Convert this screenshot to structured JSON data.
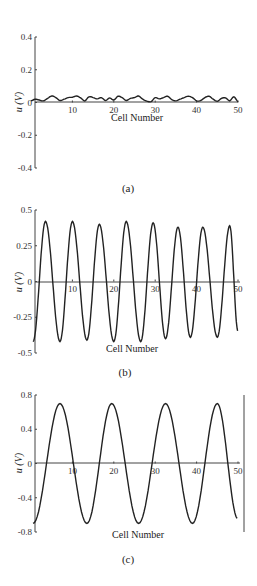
{
  "chart_data": [
    {
      "id": "a",
      "type": "line",
      "caption": "(a)",
      "title": "",
      "xlabel": "Cell Number",
      "ylabel": "u (V)",
      "xlim": [
        0,
        50
      ],
      "ylim": [
        -0.4,
        0.4
      ],
      "xticks": [
        10,
        20,
        30,
        40,
        50
      ],
      "yticks": [
        0.4,
        0.2,
        0,
        -0.2,
        -0.4
      ],
      "ytick_labels": [
        "0.4",
        "0.2",
        "0",
        "-0.2",
        "-0.4"
      ],
      "grid": false,
      "series": [
        {
          "name": "u",
          "x": [
            0,
            1,
            2,
            3,
            4,
            5,
            6,
            7,
            8,
            9,
            10,
            11,
            12,
            13,
            14,
            15,
            16,
            17,
            18,
            19,
            20,
            21,
            22,
            23,
            24,
            25,
            26,
            27,
            28,
            29,
            30,
            31,
            32,
            33,
            34,
            35,
            36,
            37,
            38,
            39,
            40,
            41,
            42,
            43,
            44,
            45,
            46,
            47,
            48,
            49,
            50
          ],
          "y": [
            0.01,
            0.02,
            0.015,
            0.01,
            0.025,
            0.04,
            0.03,
            0.012,
            0.02,
            0.03,
            0.032,
            0.04,
            0.028,
            0.01,
            0.035,
            0.03,
            0.022,
            0.03,
            0.012,
            0.028,
            0.015,
            0.038,
            0.03,
            0.012,
            0.025,
            0.03,
            0.04,
            0.02,
            0.008,
            0.005,
            0.03,
            0.022,
            0.03,
            0.038,
            0.018,
            0.01,
            0.02,
            0.03,
            0.038,
            0.03,
            0.01,
            0.012,
            0.03,
            0.038,
            0.02,
            0.008,
            0.025,
            0.028,
            0.01,
            0.035,
            0.005
          ]
        }
      ]
    },
    {
      "id": "b",
      "type": "line",
      "caption": "(b)",
      "title": "",
      "xlabel": "Cell Number",
      "ylabel": "u (V)",
      "xlim": [
        0,
        50
      ],
      "ylim": [
        -0.5,
        0.5
      ],
      "xticks": [
        10,
        20,
        30,
        40,
        50
      ],
      "yticks": [
        0.5,
        0.25,
        0,
        -0.25,
        -0.5
      ],
      "ytick_labels": [
        "0.5",
        "0.25",
        "0",
        "-0.25",
        "-0.5"
      ],
      "grid": false,
      "series": [
        {
          "name": "u",
          "model": "sinusoid",
          "amplitude_peaks": [
            0.42,
            0.42,
            0.4,
            0.42,
            0.41,
            0.38,
            0.38,
            0.39
          ],
          "amplitude_troughs": [
            -0.42,
            -0.41,
            -0.42,
            -0.42,
            -0.4,
            -0.39,
            -0.39
          ],
          "peak_x": [
            3.5,
            10,
            16.5,
            23,
            29.5,
            35.5,
            41.5,
            48
          ],
          "trough_x": [
            7,
            13.5,
            20,
            26.5,
            32.5,
            38.5,
            45
          ],
          "amplitude": 0.41,
          "period": 6.3,
          "phase_peak_x": 3.5,
          "start": [
            0.5,
            -0.42
          ],
          "end": [
            50,
            -0.35
          ]
        }
      ]
    },
    {
      "id": "c",
      "type": "line",
      "caption": "(c)",
      "title": "",
      "xlabel": "Cell Number",
      "ylabel": "u (V)",
      "xlim": [
        0,
        50
      ],
      "ylim": [
        -0.8,
        0.8
      ],
      "xticks": [
        10,
        20,
        30,
        40,
        50
      ],
      "yticks": [
        0.8,
        0.4,
        0,
        -0.4,
        -0.8
      ],
      "ytick_labels": [
        "0.8",
        "0.4",
        "0",
        "-0.4",
        "-0.8"
      ],
      "grid": false,
      "series": [
        {
          "name": "u",
          "model": "sinusoid",
          "peak_x": [
            7,
            19.5,
            32.5,
            45
          ],
          "trough_x": [
            0.5,
            13.5,
            26,
            39
          ],
          "amplitude": 0.7,
          "period": 12.7,
          "phase_peak_x": 7,
          "start": [
            0.5,
            -0.7
          ],
          "end": [
            50,
            -0.65
          ]
        }
      ]
    }
  ]
}
